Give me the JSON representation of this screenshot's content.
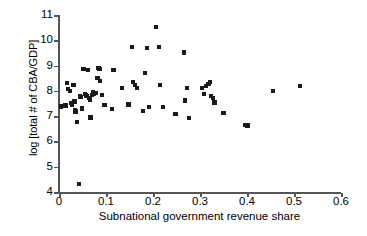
{
  "chart_data": {
    "type": "scatter",
    "title": "",
    "xlabel": "Subnational government revenue share",
    "ylabel": "log [total # of CBA/GDP]",
    "xlim": [
      0,
      0.6
    ],
    "ylim": [
      4,
      11
    ],
    "xticks": [
      0,
      0.1,
      0.2,
      0.3,
      0.4,
      0.5,
      0.6
    ],
    "xtick_labels": [
      "0",
      "0.1",
      "0.2",
      "0.3",
      "0.4",
      "0.5",
      "0.6"
    ],
    "yticks": [
      4,
      5,
      6,
      7,
      8,
      9,
      10,
      11
    ],
    "ytick_labels": [
      "4",
      "5",
      "6",
      "7",
      "8",
      "9",
      "10",
      "11"
    ],
    "grid": false,
    "legend": null,
    "marker": "square",
    "marker_color": "#1a1a1a",
    "points": [
      [
        0.004,
        7.38
      ],
      [
        0.014,
        7.42
      ],
      [
        0.017,
        8.3
      ],
      [
        0.02,
        8.08
      ],
      [
        0.023,
        8.0
      ],
      [
        0.026,
        7.52
      ],
      [
        0.027,
        7.46
      ],
      [
        0.031,
        8.22
      ],
      [
        0.033,
        7.58
      ],
      [
        0.034,
        7.22
      ],
      [
        0.035,
        7.18
      ],
      [
        0.038,
        6.78
      ],
      [
        0.042,
        4.33
      ],
      [
        0.044,
        7.78
      ],
      [
        0.047,
        7.77
      ],
      [
        0.049,
        7.3
      ],
      [
        0.052,
        8.85
      ],
      [
        0.055,
        7.88
      ],
      [
        0.057,
        7.82
      ],
      [
        0.06,
        7.8
      ],
      [
        0.062,
        8.84
      ],
      [
        0.064,
        7.73
      ],
      [
        0.066,
        7.66
      ],
      [
        0.067,
        6.95
      ],
      [
        0.07,
        7.85
      ],
      [
        0.072,
        7.96
      ],
      [
        0.074,
        7.88
      ],
      [
        0.078,
        7.92
      ],
      [
        0.082,
        8.52
      ],
      [
        0.084,
        8.92
      ],
      [
        0.086,
        8.88
      ],
      [
        0.088,
        8.38
      ],
      [
        0.092,
        7.85
      ],
      [
        0.097,
        7.44
      ],
      [
        0.112,
        7.28
      ],
      [
        0.116,
        8.82
      ],
      [
        0.134,
        8.12
      ],
      [
        0.148,
        7.46
      ],
      [
        0.156,
        9.73
      ],
      [
        0.158,
        8.36
      ],
      [
        0.162,
        8.22
      ],
      [
        0.166,
        8.12
      ],
      [
        0.178,
        7.2
      ],
      [
        0.183,
        8.72
      ],
      [
        0.188,
        9.7
      ],
      [
        0.192,
        7.35
      ],
      [
        0.206,
        10.52
      ],
      [
        0.212,
        9.75
      ],
      [
        0.215,
        8.24
      ],
      [
        0.222,
        7.35
      ],
      [
        0.248,
        7.07
      ],
      [
        0.266,
        9.52
      ],
      [
        0.268,
        7.62
      ],
      [
        0.272,
        8.12
      ],
      [
        0.276,
        6.93
      ],
      [
        0.305,
        8.1
      ],
      [
        0.308,
        7.86
      ],
      [
        0.312,
        8.18
      ],
      [
        0.318,
        8.28
      ],
      [
        0.322,
        8.34
      ],
      [
        0.324,
        7.8
      ],
      [
        0.327,
        7.73
      ],
      [
        0.331,
        7.54
      ],
      [
        0.35,
        7.14
      ],
      [
        0.397,
        6.66
      ],
      [
        0.401,
        6.63
      ],
      [
        0.455,
        7.98
      ],
      [
        0.512,
        8.2
      ]
    ]
  }
}
